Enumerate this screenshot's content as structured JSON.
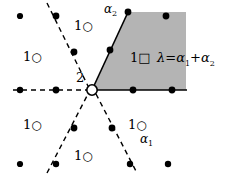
{
  "figure": {
    "type": "root-lattice-weight-diagram",
    "colors": {
      "background": "#ffffff",
      "cone_fill": "#b4b4b4",
      "line": "#000000",
      "dot": "#000000"
    },
    "origin": {
      "x": 92,
      "y": 90,
      "multiplicity_label": "2",
      "marker": "open-circle"
    },
    "lattice_spacing": {
      "x": 36,
      "y": 38
    },
    "cone": {
      "fill": "#b4b4b4",
      "apex": {
        "x": 92,
        "y": 90
      },
      "edge_upper_right": {
        "x": 128,
        "y": 12
      },
      "edge_horizontal": {
        "x": 186,
        "y": 90
      },
      "top_right": {
        "x": 186,
        "y": 12
      }
    },
    "labels": {
      "alpha1": {
        "text": "α",
        "sub": "1",
        "x": 146,
        "y": 137
      },
      "alpha2": {
        "text": "α",
        "sub": "2",
        "x": 104,
        "y": 4
      },
      "lambda_equation": {
        "lambda": "λ",
        "equals": "=",
        "term1": "α",
        "term1_sub": "1",
        "plus": "+",
        "term2": "α",
        "term2_sub": "2",
        "x": 157,
        "y": 57
      }
    },
    "weight_markers": [
      {
        "multiplicity": "1",
        "marker": "open-circle",
        "x": 82,
        "y": 25,
        "name": "weight-marker-upper-left"
      },
      {
        "multiplicity": "1",
        "marker": "open-circle",
        "x": 31,
        "y": 56,
        "name": "weight-marker-left-upper"
      },
      {
        "multiplicity": "1",
        "marker": "open-circle",
        "x": 31,
        "y": 124,
        "name": "weight-marker-left-lower"
      },
      {
        "multiplicity": "1",
        "marker": "open-circle",
        "x": 82,
        "y": 155,
        "name": "weight-marker-lower"
      },
      {
        "multiplicity": "1",
        "marker": "open-circle",
        "x": 136,
        "y": 124,
        "name": "weight-marker-lower-right"
      },
      {
        "multiplicity": "1",
        "marker": "square",
        "x": 138,
        "y": 57,
        "name": "weight-marker-in-cone"
      }
    ],
    "lattice_dots": [
      {
        "x": 20,
        "y": 16
      },
      {
        "x": 56,
        "y": 16
      },
      {
        "x": 128,
        "y": 12
      },
      {
        "x": 166,
        "y": 16
      },
      {
        "x": 74,
        "y": 52
      },
      {
        "x": 110,
        "y": 50
      },
      {
        "x": 20,
        "y": 90
      },
      {
        "x": 56,
        "y": 90
      },
      {
        "x": 133,
        "y": 90
      },
      {
        "x": 172,
        "y": 90
      },
      {
        "x": 74,
        "y": 128
      },
      {
        "x": 112,
        "y": 128
      },
      {
        "x": 20,
        "y": 164
      },
      {
        "x": 56,
        "y": 164
      },
      {
        "x": 130,
        "y": 164
      },
      {
        "x": 168,
        "y": 164
      }
    ],
    "axis_lines": {
      "dashed": [
        {
          "name": "axis-horizontal-left",
          "x1": 14,
          "y1": 90,
          "x2": 88,
          "y2": 90
        },
        {
          "name": "axis-diagonal-upper-left",
          "x1": 48,
          "y1": 4,
          "x2": 88,
          "y2": 86
        },
        {
          "name": "axis-diagonal-lower-left",
          "x1": 48,
          "y1": 172,
          "x2": 88,
          "y2": 94
        },
        {
          "name": "axis-diagonal-lower-right",
          "x1": 96,
          "y1": 94,
          "x2": 136,
          "y2": 172
        }
      ],
      "solid": [
        {
          "name": "cone-edge-upper",
          "x1": 92,
          "y1": 90,
          "x2": 128,
          "y2": 12
        },
        {
          "name": "cone-edge-lower",
          "x1": 92,
          "y1": 90,
          "x2": 186,
          "y2": 90
        }
      ]
    }
  }
}
